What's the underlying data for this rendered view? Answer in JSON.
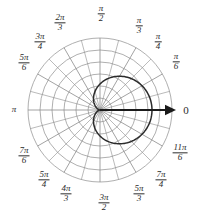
{
  "figure": {
    "origin_label": "0",
    "colors": {
      "grid": "#8c8c8c",
      "curve": "#2b2b2b",
      "axis": "#1a1a1a",
      "text": "#2b2b2b",
      "background": "#ffffff"
    }
  },
  "angle_labels": [
    {
      "name": "angle-0",
      "num": "",
      "den": "",
      "whole": "0",
      "x": 186,
      "y": 110
    },
    {
      "name": "angle-pi-6",
      "num": "π",
      "den": "6",
      "whole": "",
      "x": 176,
      "y": 62
    },
    {
      "name": "angle-pi-4",
      "num": "π",
      "den": "4",
      "whole": "",
      "x": 158,
      "y": 42
    },
    {
      "name": "angle-pi-3",
      "num": "π",
      "den": "3",
      "whole": "",
      "x": 139,
      "y": 26
    },
    {
      "name": "angle-pi-2",
      "num": "π",
      "den": "2",
      "whole": "",
      "x": 101,
      "y": 14
    },
    {
      "name": "angle-2pi-3",
      "num": "2π",
      "den": "3",
      "whole": "",
      "x": 60,
      "y": 23
    },
    {
      "name": "angle-3pi-4",
      "num": "3π",
      "den": "4",
      "whole": "",
      "x": 40,
      "y": 42
    },
    {
      "name": "angle-5pi-6",
      "num": "5π",
      "den": "6",
      "whole": "",
      "x": 24,
      "y": 63
    },
    {
      "name": "angle-pi",
      "num": "",
      "den": "",
      "whole": "π",
      "x": 14,
      "y": 110
    },
    {
      "name": "angle-7pi-6",
      "num": "7π",
      "den": "6",
      "whole": "",
      "x": 24,
      "y": 156
    },
    {
      "name": "angle-5pi-4",
      "num": "5π",
      "den": "4",
      "whole": "",
      "x": 44,
      "y": 180
    },
    {
      "name": "angle-4pi-3",
      "num": "4π",
      "den": "3",
      "whole": "",
      "x": 66,
      "y": 194
    },
    {
      "name": "angle-3pi-2",
      "num": "3π",
      "den": "2",
      "whole": "",
      "x": 104,
      "y": 203
    },
    {
      "name": "angle-5pi-3",
      "num": "5π",
      "den": "3",
      "whole": "",
      "x": 139,
      "y": 194
    },
    {
      "name": "angle-7pi-4",
      "num": "7π",
      "den": "4",
      "whole": "",
      "x": 161,
      "y": 180
    },
    {
      "name": "angle-11pi-6",
      "num": "11π",
      "den": "6",
      "whole": "",
      "x": 180,
      "y": 153
    }
  ],
  "chart_data": {
    "type": "line",
    "coordinate_system": "polar",
    "title": "",
    "xlabel": "",
    "ylabel": "",
    "curve_name": "cardioid",
    "equation": "r = a(1 + cos θ)",
    "amplitude_a": 26,
    "grid": {
      "center_x": 100,
      "center_y": 110,
      "circle_count": 6,
      "circle_radii": [
        12,
        24,
        36,
        48,
        60,
        72
      ],
      "radial_spoke_count": 24,
      "radial_spoke_step_deg": 15,
      "labeled_spoke_step_deg": 30
    },
    "axis_arrow": {
      "from_x": 100,
      "from_y": 110,
      "to_x": 176,
      "to_y": 110
    },
    "theta_labels_rad": [
      "0",
      "π/6",
      "π/4",
      "π/3",
      "π/2",
      "2π/3",
      "3π/4",
      "5π/6",
      "π",
      "7π/6",
      "5π/4",
      "4π/3",
      "3π/2",
      "5π/3",
      "7π/4",
      "11π/6"
    ],
    "theta_deg": [
      0,
      30,
      45,
      60,
      90,
      120,
      135,
      150,
      180,
      210,
      225,
      240,
      270,
      300,
      315,
      330
    ],
    "r_values": [
      52,
      45.0,
      44.4,
      39.0,
      26,
      13.0,
      7.6,
      3.5,
      0,
      3.5,
      7.6,
      13.0,
      26,
      39.0,
      44.4,
      45.0
    ],
    "r_max_on_grid": 72,
    "legend": []
  }
}
